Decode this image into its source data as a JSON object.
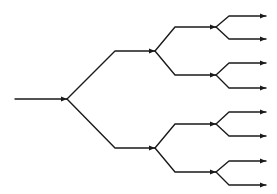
{
  "diagram": {
    "type": "binary-tree",
    "orientation": "left-to-right",
    "levels": 3,
    "leaf_count": 8,
    "colors": {
      "line": "#1a1a1a",
      "background": "#ffffff"
    },
    "input": {
      "from": [
        15,
        99
      ],
      "to": [
        67,
        99
      ]
    },
    "branches": [
      {
        "level": 1,
        "node": [
          67,
          99
        ],
        "up": [
          115,
          51
        ],
        "down": [
          115,
          148
        ],
        "end_x": 155
      },
      {
        "level": 2,
        "node": [
          155,
          51
        ],
        "up": [
          175,
          27
        ],
        "down": [
          175,
          75
        ],
        "end_x": 216
      },
      {
        "level": 2,
        "node": [
          155,
          148
        ],
        "up": [
          175,
          124
        ],
        "down": [
          175,
          172
        ],
        "end_x": 216
      },
      {
        "level": 3,
        "node": [
          216,
          27
        ],
        "up": [
          229,
          16
        ],
        "down": [
          229,
          39
        ],
        "end_x": 266
      },
      {
        "level": 3,
        "node": [
          216,
          75
        ],
        "up": [
          229,
          63
        ],
        "down": [
          229,
          88
        ],
        "end_x": 266
      },
      {
        "level": 3,
        "node": [
          216,
          124
        ],
        "up": [
          229,
          112
        ],
        "down": [
          229,
          136
        ],
        "end_x": 266
      },
      {
        "level": 3,
        "node": [
          216,
          172
        ],
        "up": [
          229,
          161
        ],
        "down": [
          229,
          185
        ],
        "end_x": 266
      }
    ]
  }
}
